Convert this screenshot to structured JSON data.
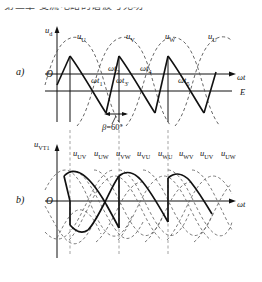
{
  "header": {
    "cropped_text": "第二章 变流电路的谐波与无功"
  },
  "figure": {
    "panel_a": {
      "label": "a)",
      "y_axis_label": "u",
      "y_axis_sub": "d",
      "x_axis_label": "ωt",
      "origin_label": "O",
      "dc_level_label": "E",
      "wave_labels": [
        {
          "base": "u",
          "sub": "U"
        },
        {
          "base": "u",
          "sub": "V"
        },
        {
          "base": "u",
          "sub": "W"
        },
        {
          "base": "u",
          "sub": "U"
        }
      ],
      "time_marks": [
        {
          "base": "ωt",
          "sub": "1"
        },
        {
          "base": "ωt",
          "sub": "2"
        },
        {
          "base": "ωt",
          "sub": "3'"
        },
        {
          "base": "ωt",
          "sub": "4"
        },
        {
          "base": "ωt",
          "sub": "5"
        }
      ],
      "angle_annotation": {
        "symbol": "β",
        "equals": "=",
        "value": "60°"
      }
    },
    "panel_b": {
      "label": "b)",
      "y_axis_label": "u",
      "y_axis_sub": "VT1",
      "x_axis_label": "ωt",
      "origin_label": "O",
      "wave_labels": [
        {
          "base": "u",
          "sub": "UV"
        },
        {
          "base": "u",
          "sub": "UW"
        },
        {
          "base": "u",
          "sub": "VW"
        },
        {
          "base": "u",
          "sub": "VU"
        },
        {
          "base": "u",
          "sub": "WU"
        },
        {
          "base": "u",
          "sub": "WV"
        },
        {
          "base": "u",
          "sub": "UV"
        },
        {
          "base": "u",
          "sub": "UW"
        }
      ]
    }
  },
  "colors": {
    "ink": "#111111",
    "dashed": "#555555",
    "background": "#ffffff"
  }
}
